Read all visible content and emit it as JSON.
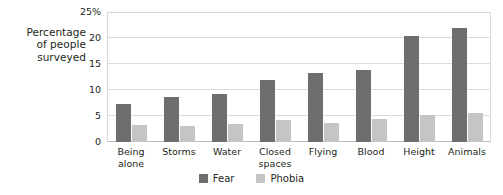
{
  "chart_data": {
    "type": "bar",
    "title": "",
    "xlabel": "",
    "ylabel": "Percentage of people surveyed",
    "ylabel_lines": [
      "Percentage",
      "of people",
      "surveyed"
    ],
    "categories": [
      "Being alone",
      "Storms",
      "Water",
      "Closed spaces",
      "Flying",
      "Blood",
      "Height",
      "Animals"
    ],
    "category_lines": [
      [
        "Being",
        "alone"
      ],
      [
        "Storms"
      ],
      [
        "Water"
      ],
      [
        "Closed",
        "spaces"
      ],
      [
        "Flying"
      ],
      [
        "Blood"
      ],
      [
        "Height"
      ],
      [
        "Animals"
      ]
    ],
    "series": [
      {
        "name": "Fear",
        "color": "#6d6e70",
        "values": [
          7.3,
          8.7,
          9.3,
          12.0,
          13.2,
          13.9,
          20.3,
          21.9
        ]
      },
      {
        "name": "Phobia",
        "color": "#c4c5c6",
        "values": [
          3.2,
          3.0,
          3.4,
          4.3,
          3.6,
          4.4,
          5.1,
          5.5
        ]
      }
    ],
    "ylim": [
      0,
      25
    ],
    "yticks": [
      0,
      5,
      10,
      15,
      20,
      25
    ],
    "ytick_labels": [
      "0",
      "5",
      "10",
      "15",
      "20",
      "25%"
    ],
    "grid": true,
    "legend_position": "bottom-center"
  },
  "legend": {
    "items": [
      {
        "label": "Fear",
        "swatch": "fear"
      },
      {
        "label": "Phobia",
        "swatch": "phobia"
      }
    ]
  }
}
